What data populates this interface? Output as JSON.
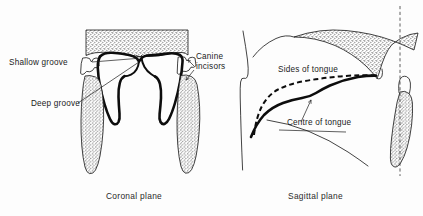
{
  "figure": {
    "background_color": "#fdfdfd",
    "ink_color": "#141414"
  },
  "panels": [
    {
      "id": "coronal",
      "caption": "Coronal plane",
      "labels": [
        {
          "id": "shallow-groove",
          "text": "Shallow groove"
        },
        {
          "id": "deep-groove",
          "text": "Deep groove"
        },
        {
          "id": "canine-incisors",
          "line1": "Canine",
          "line2": "incisors"
        }
      ],
      "structures": [
        "hard palate",
        "tongue outline",
        "shallow median groove",
        "deep lateral groove",
        "canine tooth crown left",
        "canine tooth crown right",
        "tooth root left",
        "tooth root right"
      ]
    },
    {
      "id": "sagittal",
      "caption": "Sagittal plane",
      "labels": [
        {
          "id": "sides-of-tongue",
          "text": "Sides of tongue"
        },
        {
          "id": "centre-of-tongue",
          "text": "Centre of tongue"
        }
      ],
      "structures": [
        "lip profile",
        "hard palate arch",
        "sides of tongue contour",
        "centre of tongue contour",
        "floor of mouth",
        "molar tooth root",
        "vertical reference line"
      ]
    }
  ],
  "legend": {
    "dashed_curve_meaning": "Sides of tongue",
    "solid_curve_meaning": "Centre of tongue"
  }
}
